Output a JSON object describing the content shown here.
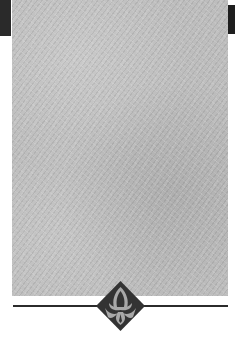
{
  "page": {
    "type": "scanned-book-page",
    "content": "decorative texture panel with diamond ornament and horizontal rule"
  },
  "colors": {
    "texture": "#bdbdbd",
    "ornament_dark": "#333333",
    "ornament_light": "#a8a8a8",
    "rule": "#2b2b2b",
    "background": "#ffffff"
  },
  "ornament": {
    "icon": "diamond-floral-ornament-icon"
  }
}
